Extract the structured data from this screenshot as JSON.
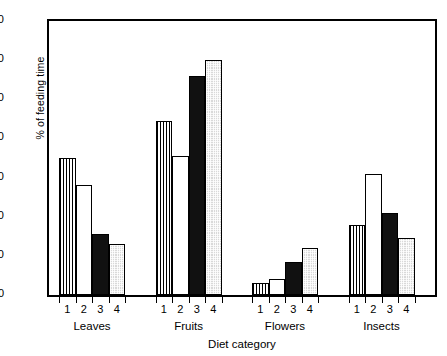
{
  "chart_data": {
    "type": "bar",
    "title": "",
    "xlabel": "Diet category",
    "ylabel": "% of feeding time",
    "ylim": [
      0,
      70
    ],
    "yticks": [
      0,
      10,
      20,
      30,
      40,
      50,
      60,
      70
    ],
    "grid": false,
    "legend": "none",
    "categories": [
      "Leaves",
      "Fruits",
      "Flowers",
      "Insects"
    ],
    "subcategories": [
      "1",
      "2",
      "3",
      "4"
    ],
    "series": [
      {
        "name": "1",
        "pattern": "vertical-stripes",
        "values": [
          35,
          44.5,
          3,
          18
        ]
      },
      {
        "name": "2",
        "pattern": "white-empty",
        "values": [
          28,
          35.5,
          4,
          31
        ]
      },
      {
        "name": "3",
        "pattern": "solid-black",
        "values": [
          15.5,
          56,
          8.5,
          21
        ]
      },
      {
        "name": "4",
        "pattern": "grey-stipple",
        "values": [
          13,
          60,
          12,
          14.5
        ]
      }
    ],
    "groups": [
      {
        "label": "Leaves",
        "bars": [
          {
            "sub": "1",
            "value": 35,
            "pattern": "vertical-stripes"
          },
          {
            "sub": "2",
            "value": 28,
            "pattern": "white-empty"
          },
          {
            "sub": "3",
            "value": 15.5,
            "pattern": "solid-black"
          },
          {
            "sub": "4",
            "value": 13,
            "pattern": "grey-stipple"
          }
        ]
      },
      {
        "label": "Fruits",
        "bars": [
          {
            "sub": "1",
            "value": 44.5,
            "pattern": "vertical-stripes"
          },
          {
            "sub": "2",
            "value": 35.5,
            "pattern": "white-empty"
          },
          {
            "sub": "3",
            "value": 56,
            "pattern": "solid-black"
          },
          {
            "sub": "4",
            "value": 60,
            "pattern": "grey-stipple"
          }
        ]
      },
      {
        "label": "Flowers",
        "bars": [
          {
            "sub": "1",
            "value": 3,
            "pattern": "vertical-stripes"
          },
          {
            "sub": "2",
            "value": 4,
            "pattern": "white-empty"
          },
          {
            "sub": "3",
            "value": 8.5,
            "pattern": "solid-black"
          },
          {
            "sub": "4",
            "value": 12,
            "pattern": "grey-stipple"
          }
        ]
      },
      {
        "label": "Insects",
        "bars": [
          {
            "sub": "1",
            "value": 18,
            "pattern": "vertical-stripes"
          },
          {
            "sub": "2",
            "value": 31,
            "pattern": "white-empty"
          },
          {
            "sub": "3",
            "value": 21,
            "pattern": "solid-black"
          },
          {
            "sub": "4",
            "value": 14.5,
            "pattern": "grey-stipple"
          }
        ]
      }
    ],
    "colors": {
      "axis": "#000000",
      "bar_outline": "#000000",
      "solid_black": "#111111",
      "grey_stipple": "#d9d9d9",
      "background": "#ffffff"
    }
  }
}
